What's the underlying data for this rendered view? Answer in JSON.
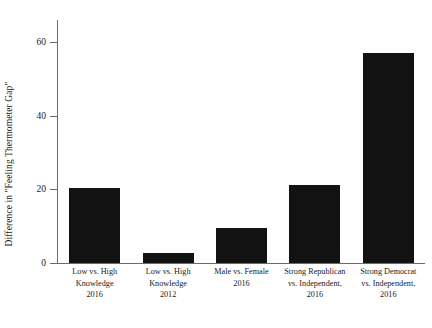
{
  "chart_data": {
    "type": "bar",
    "title": "",
    "xlabel": "",
    "ylabel": "Difference in \"Feeling Thermometer Gap\"",
    "ylim": [
      0,
      66
    ],
    "yticks": [
      0,
      20,
      40,
      60
    ],
    "ytick_labels": [
      "0",
      "20",
      "40",
      "60"
    ],
    "grid": false,
    "legend": false,
    "bar_color": "#121212",
    "axis_color": "#6b6b6b",
    "categories": [
      "Low vs. High Knowledge 2016",
      "Low vs. High Knowledge 2012",
      "Male vs. Female 2016",
      "Strong Republican vs. Independent, 2016",
      "Strong Democrat vs. Independent, 2016"
    ],
    "category_lines": [
      [
        "Low vs. High",
        "Knowledge",
        "2016"
      ],
      [
        "Low vs. High",
        "Knowledge",
        "2012"
      ],
      [
        "Male vs. Female",
        "2016"
      ],
      [
        "Strong Republican",
        "vs. Independent,",
        "2016"
      ],
      [
        "Strong Democrat",
        "vs. Independent,",
        "2016"
      ]
    ],
    "values": [
      20.3,
      2.8,
      9.6,
      21.3,
      57.0
    ]
  }
}
